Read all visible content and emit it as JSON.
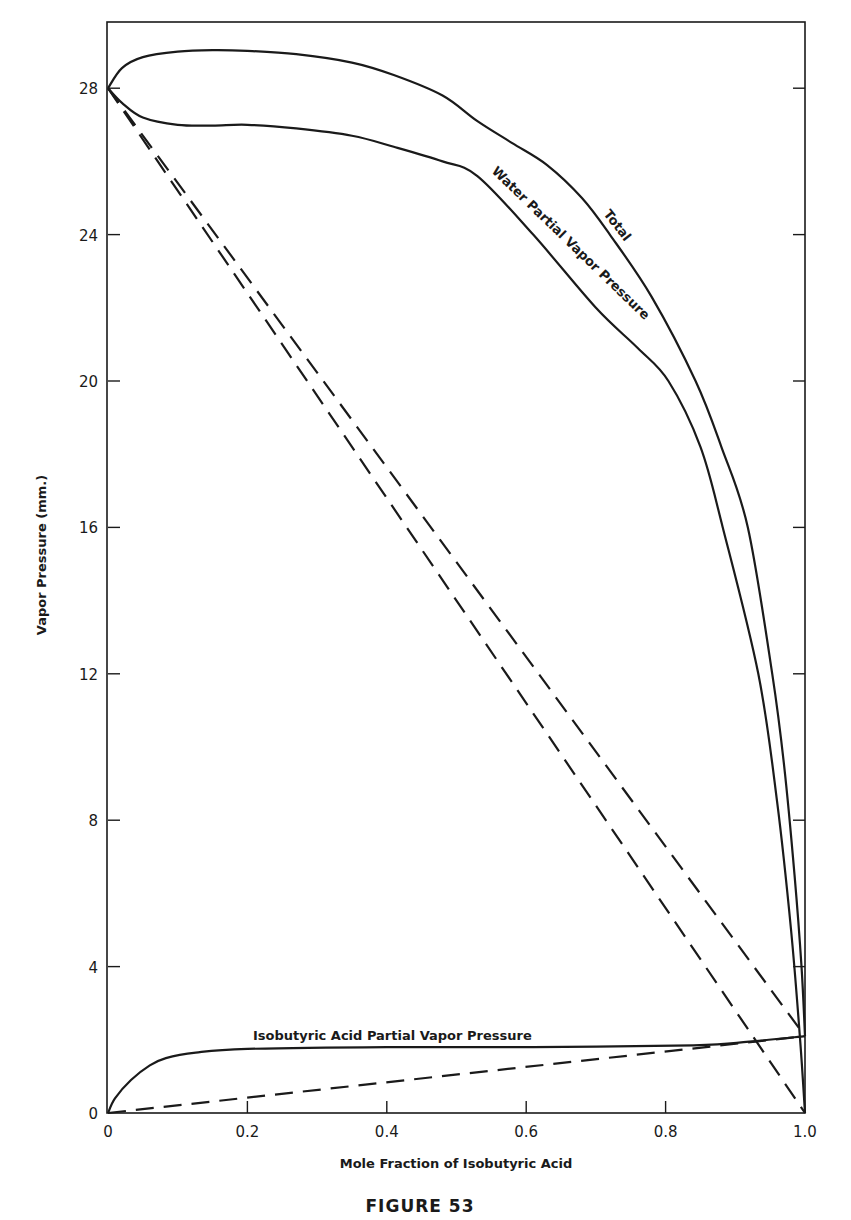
{
  "figure": {
    "caption": "FIGURE 53"
  },
  "chart_data": {
    "type": "line",
    "title": "",
    "caption": "FIGURE 53",
    "xlabel": "Mole Fraction of Isobutyric Acid",
    "ylabel": "Vapor Pressure (mm.)",
    "xlim": [
      0,
      1.0
    ],
    "ylim": [
      0,
      29.8
    ],
    "grid": false,
    "legend": "none (curves labeled inline)",
    "x_ticks": [
      0,
      0.2,
      0.4,
      0.6,
      0.8,
      1.0
    ],
    "x_tick_labels": [
      "0",
      "0.2",
      "0.4",
      "0.6",
      "0.8",
      "1.0"
    ],
    "y_ticks": [
      0,
      4,
      8,
      12,
      16,
      20,
      24,
      28
    ],
    "y_tick_labels": [
      "0",
      "4",
      "8",
      "12",
      "16",
      "20",
      "24",
      "28"
    ],
    "series": [
      {
        "name": "Total",
        "style": "solid",
        "label": "Total",
        "x": [
          0,
          0.02,
          0.05,
          0.1,
          0.15,
          0.2,
          0.27,
          0.35,
          0.41,
          0.48,
          0.53,
          0.58,
          0.63,
          0.68,
          0.72,
          0.78,
          0.843,
          0.88,
          0.918,
          0.953,
          0.97,
          0.985,
          0.995,
          1.0
        ],
        "y": [
          28.0,
          28.55,
          28.85,
          29.0,
          29.04,
          29.02,
          28.93,
          28.7,
          28.36,
          27.8,
          27.1,
          26.5,
          25.9,
          25.0,
          24.0,
          22.3,
          20.0,
          18.2,
          16.0,
          12.0,
          9.5,
          6.5,
          4.0,
          2.1
        ]
      },
      {
        "name": "Water Partial Vapor Pressure",
        "style": "solid",
        "label": "Water Partial Vapor Pressure",
        "x": [
          0,
          0.02,
          0.05,
          0.1,
          0.15,
          0.2,
          0.27,
          0.35,
          0.41,
          0.48,
          0.53,
          0.61,
          0.7,
          0.76,
          0.804,
          0.85,
          0.882,
          0.933,
          0.96,
          0.98,
          0.993,
          1.0
        ],
        "y": [
          28.0,
          27.6,
          27.2,
          27.0,
          26.98,
          27.0,
          26.9,
          26.7,
          26.4,
          26.0,
          25.6,
          24.0,
          22.0,
          20.9,
          20.0,
          18.2,
          16.0,
          12.0,
          8.5,
          5.0,
          2.0,
          0.0
        ]
      },
      {
        "name": "Isobutyric Acid Partial Vapor Pressure",
        "style": "solid",
        "label": "Isobutyric Acid Partial Vapor Pressure",
        "x": [
          0,
          0.01,
          0.033,
          0.06,
          0.083,
          0.126,
          0.2,
          0.4,
          0.61,
          0.84,
          0.92,
          1.0
        ],
        "y": [
          0.0,
          0.4,
          0.9,
          1.3,
          1.5,
          1.65,
          1.75,
          1.8,
          1.8,
          1.85,
          1.95,
          2.1
        ]
      },
      {
        "name": "Ideal water (Raoult) line",
        "style": "dashed",
        "x": [
          0,
          1.0
        ],
        "y": [
          28.0,
          0.0
        ]
      },
      {
        "name": "Ideal total (Raoult) line",
        "style": "dashed",
        "x": [
          0,
          1.0
        ],
        "y": [
          28.0,
          2.1
        ]
      },
      {
        "name": "Ideal isobutyric acid (Raoult) line",
        "style": "dashed",
        "x": [
          0,
          1.0
        ],
        "y": [
          0.0,
          2.1
        ]
      }
    ],
    "annotations": [
      {
        "text": "Total",
        "near": {
          "x": 0.72,
          "y": 25.0
        },
        "rotation_deg": 52
      },
      {
        "text": "Water Partial Vapor Pressure",
        "near": {
          "x": 0.7,
          "y": 23.0
        },
        "rotation_deg": 45
      },
      {
        "text": "Isobutyric Acid Partial Vapor Pressure",
        "near": {
          "x": 0.4,
          "y": 2.4
        },
        "rotation_deg": 0
      }
    ]
  }
}
